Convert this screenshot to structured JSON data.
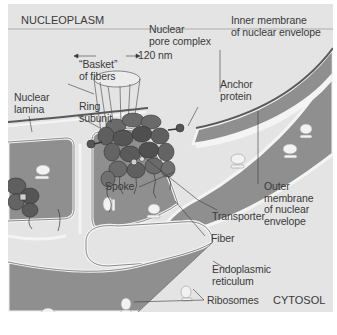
{
  "figure": {
    "regions": {
      "top_left": "NUCLEOPLASM",
      "bottom_right": "CYTOSOL"
    },
    "labels": {
      "nuclear_pore_complex": "Nuclear\npore complex",
      "scale": "120 nm",
      "inner_membrane": "Inner membrane\nof nuclear envelope",
      "basket": "“Basket”\nof fibers",
      "anchor_protein": "Anchor\nprotein",
      "nuclear_lamina": "Nuclear\nlamina",
      "ring_subunit": "Ring\nsubunit",
      "spoke": "Spoke",
      "outer_membrane": "Outer\nmembrane\nof nuclear\nenvelope",
      "transporter": "Transporter",
      "fiber": "Fiber",
      "er": "Endoplasmic\nreticulum",
      "ribosomes": "Ribosomes"
    },
    "colors": {
      "background": "#e4e4e4",
      "lumen": "#8f8f8f",
      "membrane_light": "#f4f4f4",
      "membrane_dark": "#5a5a5a",
      "protein": "#5f5f5f",
      "protein_dark": "#454545",
      "ribosome": "#f2f2f2",
      "text": "#3a3a3a"
    }
  }
}
